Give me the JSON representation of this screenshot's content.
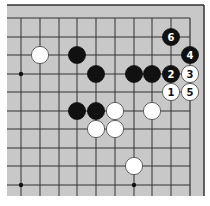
{
  "board": {
    "background_color": "#c8c8c8",
    "line_color": "#333333",
    "frame": {
      "left": 7,
      "top": 5,
      "right": 204,
      "bottom": 196
    },
    "grid": {
      "x": [
        21,
        40,
        59,
        77,
        96,
        115,
        134,
        152,
        171,
        190
      ],
      "y": [
        18,
        37,
        55,
        74,
        92,
        111,
        129,
        148,
        166,
        185
      ]
    },
    "edges": [
      "top",
      "right"
    ],
    "star_points": [
      {
        "col": 0,
        "row": 3
      },
      {
        "col": 0,
        "row": 9
      },
      {
        "col": 6,
        "row": 9
      }
    ],
    "stone_radius": 8.6
  },
  "stones": [
    {
      "color": "white",
      "col": 1,
      "row": 2,
      "label": ""
    },
    {
      "color": "black",
      "col": 3,
      "row": 2,
      "label": ""
    },
    {
      "color": "black",
      "col": 4,
      "row": 3,
      "label": ""
    },
    {
      "color": "black",
      "col": 6,
      "row": 3,
      "label": ""
    },
    {
      "color": "black",
      "col": 7,
      "row": 3,
      "label": ""
    },
    {
      "color": "black",
      "col": 3,
      "row": 5,
      "label": ""
    },
    {
      "color": "black",
      "col": 4,
      "row": 5,
      "label": ""
    },
    {
      "color": "white",
      "col": 5,
      "row": 5,
      "label": ""
    },
    {
      "color": "white",
      "col": 7,
      "row": 5,
      "label": ""
    },
    {
      "color": "white",
      "col": 4,
      "row": 6,
      "label": ""
    },
    {
      "color": "white",
      "col": 5,
      "row": 6,
      "label": ""
    },
    {
      "color": "white",
      "col": 6,
      "row": 8,
      "label": ""
    },
    {
      "color": "white",
      "col": 8,
      "row": 4,
      "label": "1"
    },
    {
      "color": "black",
      "col": 8,
      "row": 3,
      "label": "2"
    },
    {
      "color": "white",
      "col": 9,
      "row": 3,
      "label": "3"
    },
    {
      "color": "black",
      "col": 9,
      "row": 2,
      "label": "4"
    },
    {
      "color": "white",
      "col": 9,
      "row": 4,
      "label": "5"
    },
    {
      "color": "black",
      "col": 8,
      "row": 1,
      "label": "6"
    }
  ]
}
